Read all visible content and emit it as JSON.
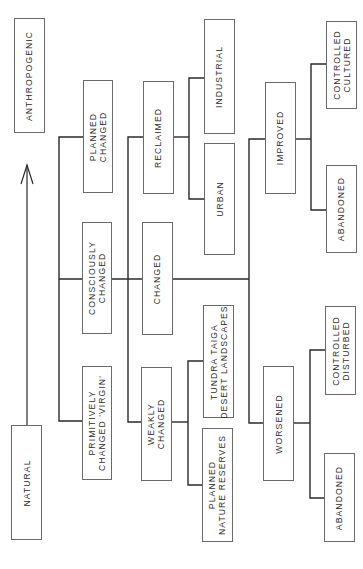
{
  "diagram": {
    "orientation": "rotated 90deg counter-clockwise (read with left edge up)",
    "axis": {
      "low_label": "NATURAL",
      "high_label": "ANTHROPOGENIC",
      "arrow_direction": "from NATURAL toward ANTHROPOGENIC"
    },
    "nodes": {
      "anthropogenic": "ANTHROPOGENIC",
      "natural": "NATURAL",
      "planned_changed": "PLANNED\nCHANGED",
      "consciously_changed": "CONSCIOUSLY\nCHANGED",
      "primitively_changed": "PRIMITIVELY\nCHANGED 'VIRGIN'",
      "reclaimed": "RECLAIMED",
      "changed": "CHANGED",
      "weakly_changed": "WEAKLY\nCHANGED",
      "industrial": "INDUSTRIAL",
      "urban": "URBAN",
      "tundra": "TUNDRA TAIGA\nDESERT LANDSCAPES",
      "planned_reserves": "PLANNED\nNATURE RESERVES",
      "improved": "IMPROVED",
      "worsened": "WORSENED",
      "controlled_cultured": "CONTROLLED\nCULTURED",
      "abandoned_top": "ABANDONED",
      "controlled_disturbed": "CONTROLLED\nDISTURBED",
      "abandoned_bottom": "ABANDONED"
    },
    "hierarchy": [
      {
        "level": "degree of change",
        "items": [
          "PLANNED CHANGED",
          "CONSCIOUSLY CHANGED",
          "PRIMITIVELY CHANGED 'VIRGIN'"
        ]
      },
      {
        "level": "type",
        "items": [
          "RECLAIMED",
          "CHANGED",
          "WEAKLY CHANGED"
        ]
      },
      {
        "parent": "RECLAIMED",
        "children": [
          "INDUSTRIAL",
          "URBAN"
        ]
      },
      {
        "parent": "WEAKLY CHANGED",
        "children": [
          "TUNDRA TAIGA DESERT LANDSCAPES",
          "PLANNED NATURE RESERVES"
        ]
      },
      {
        "parent": "CHANGED",
        "children": [
          "IMPROVED",
          "WORSENED"
        ]
      },
      {
        "parent": "IMPROVED",
        "children": [
          "CONTROLLED CULTURED",
          "ABANDONED"
        ]
      },
      {
        "parent": "WORSENED",
        "children": [
          "CONTROLLED DISTURBED",
          "ABANDONED"
        ]
      }
    ],
    "colors": {
      "line": "#2a2a2a",
      "box_border": "#6a6a6a",
      "text": "#2c2c2c",
      "background": "#ffffff"
    }
  }
}
